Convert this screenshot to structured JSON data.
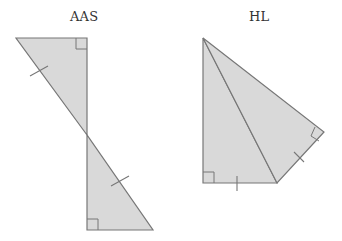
{
  "diagram": {
    "type": "geometry-congruence-figures",
    "colors": {
      "fill": "#d9d9d9",
      "stroke": "#777777",
      "background": "#ffffff",
      "text": "#333333"
    },
    "figures": [
      {
        "id": "aas",
        "label": "AAS",
        "description": "Two right triangles meeting at a vertex along a shared vertical line, with congruent hypotenuse tick marks and right-angle markers",
        "triangles": [
          {
            "vertices": [
              [
                16,
                38
              ],
              [
                87,
                38
              ],
              [
                87,
                135
              ]
            ],
            "right_angle_at": [
              87,
              38
            ]
          },
          {
            "vertices": [
              [
                87,
                135
              ],
              [
                87,
                230
              ],
              [
                153,
                230
              ]
            ],
            "right_angle_at": [
              87,
              230
            ]
          }
        ],
        "tick_marks": [
          {
            "from": [
              30,
              76
            ],
            "to": [
              48,
              66
            ]
          },
          {
            "from": [
              111,
              186
            ],
            "to": [
              129,
              176
            ]
          }
        ]
      },
      {
        "id": "hl",
        "label": "HL",
        "description": "Two right triangles sharing a hypotenuse from the top apex, with congruent legs marked by ticks and right-angle markers",
        "triangles": [
          {
            "vertices": [
              [
                203,
                38
              ],
              [
                203,
                183
              ],
              [
                277,
                183
              ]
            ],
            "right_angle_at": [
              203,
              183
            ]
          },
          {
            "vertices": [
              [
                203,
                38
              ],
              [
                277,
                183
              ],
              [
                324,
                132
              ]
            ],
            "right_angle_at": [
              324,
              132
            ]
          }
        ],
        "tick_marks": [
          {
            "from": [
              237,
              176
            ],
            "to": [
              237,
              191
            ]
          },
          {
            "from": [
              294,
              150
            ],
            "to": [
              306,
              162
            ]
          }
        ]
      }
    ]
  }
}
